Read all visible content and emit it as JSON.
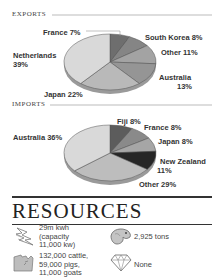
{
  "chart_data": [
    {
      "type": "pie",
      "title": "EXPORTS",
      "categories": [
        "France",
        "South Korea",
        "Other",
        "Australia",
        "Japan",
        "Netherlands"
      ],
      "values": [
        7,
        8,
        11,
        13,
        22,
        39
      ],
      "labels": [
        "France 7%",
        "South Korea 8%",
        "Other 11%",
        "Australia 13%",
        "Japan 22%",
        "Netherlands 39%"
      ],
      "colors": [
        "#6e6e6e",
        "#858585",
        "#a3a3a3",
        "#959595",
        "#b9b9b9",
        "#d9d9d9"
      ]
    },
    {
      "type": "pie",
      "title": "IMPORTS",
      "categories": [
        "Fiji",
        "France",
        "Japan",
        "New Zealand",
        "Other",
        "Australia"
      ],
      "values": [
        8,
        8,
        8,
        11,
        29,
        36
      ],
      "labels": [
        "Fiji 8%",
        "France 8%",
        "Japan 8%",
        "New Zealand 11%",
        "Other 29%",
        "Australia 36%"
      ],
      "colors": [
        "#5c5c5c",
        "#8a8a8a",
        "#a6a6a6",
        "#262626",
        "#bdbdbd",
        "#d9d9d9"
      ]
    }
  ],
  "exports": {
    "heading": "EXPORTS",
    "labels": {
      "france": "France 7%",
      "south_korea": "South Korea 8%",
      "other": "Other 11%",
      "australia_name": "Australia",
      "australia_pct": "13%",
      "japan": "Japan 22%",
      "netherlands_name": "Netherlands",
      "netherlands_pct": "39%"
    }
  },
  "imports": {
    "heading": "IMPORTS",
    "labels": {
      "fiji": "Fiji 8%",
      "france": "France 8%",
      "japan": "Japan 8%",
      "new_zealand_name": "New Zealand",
      "new_zealand_pct": "11%",
      "other": "Other 29%",
      "australia": "Australia 36%"
    }
  },
  "resources": {
    "heading": "RESOURCES",
    "items": [
      {
        "icon": "lightning-icon",
        "lines": [
          "29m kwh",
          "(capacity",
          "11,000 kw)"
        ]
      },
      {
        "icon": "fish-icon",
        "lines": [
          "2,925 tons"
        ]
      },
      {
        "icon": "livestock-icon",
        "lines": [
          "132,000 cattle,",
          "59,000 pigs,",
          "11,000 goats"
        ]
      },
      {
        "icon": "diamond-icon",
        "lines": [
          "None"
        ]
      }
    ]
  }
}
